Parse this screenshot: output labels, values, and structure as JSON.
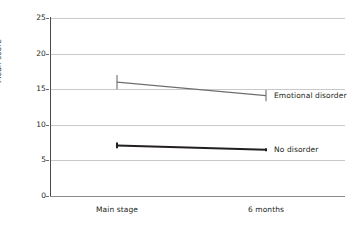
{
  "chart_data": {
    "type": "line",
    "title": "",
    "subtitle": "",
    "xlabel": "",
    "ylabel": "Mean score",
    "categories": [
      "Main stage",
      "6 months"
    ],
    "x": [
      0,
      1
    ],
    "ylim": [
      0,
      25
    ],
    "yticks": [
      0,
      5,
      10,
      15,
      20,
      25
    ],
    "ytick_labels": [
      "0",
      "5",
      "10",
      "15",
      "20",
      "25"
    ],
    "grid": "horizontal",
    "legend_position": "right-of-line-endpoints",
    "series": [
      {
        "name": "Emotional disorder",
        "values": [
          16.0,
          14.1
        ],
        "err_low": [
          15.0,
          13.3
        ],
        "err_high": [
          17.0,
          14.9
        ],
        "color": "#6e6e6e",
        "line_width": 1.1,
        "label_x": 1,
        "label_y": 14.1
      },
      {
        "name": "No disorder",
        "values": [
          7.1,
          6.5
        ],
        "err_low": [
          6.7,
          6.3
        ],
        "err_high": [
          7.5,
          6.7
        ],
        "color": "#231f20",
        "line_width": 2.0,
        "label_x": 1,
        "label_y": 6.5
      }
    ],
    "annotations": []
  },
  "axes": {
    "y_axis_color": "#4a4a4a",
    "x_axis_color": "#8a8a8a",
    "gridline_color": "#c9c9c9",
    "background": "#ffffff"
  }
}
